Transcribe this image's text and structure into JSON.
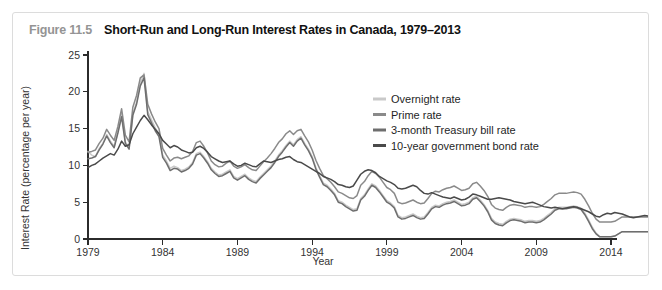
{
  "figure": {
    "number": "Figure 11.5",
    "title": "Short-Run and Long-Run Interest Rates in Canada, 1979–2013"
  },
  "chart_data": {
    "type": "line",
    "title": "Short-Run and Long-Run Interest Rates in Canada, 1979–2013",
    "xlabel": "Year",
    "ylabel": "Interest Rate (percentage per year)",
    "xlim": [
      1979,
      2014
    ],
    "ylim": [
      0,
      25
    ],
    "xticks": [
      1979,
      1984,
      1989,
      1994,
      1999,
      2004,
      2009,
      2014
    ],
    "yticks": [
      0,
      5,
      10,
      15,
      20,
      25
    ],
    "grid": false,
    "legend_position": "inside-top-right",
    "x_step": 0.25,
    "series": [
      {
        "name": "Overnight rate",
        "color": "#c9c9c9",
        "values": [
          11.9,
          11.4,
          11.2,
          12.3,
          13.0,
          14.2,
          13.3,
          12.6,
          14.6,
          16.9,
          13.2,
          12.4,
          17.0,
          18.6,
          21.2,
          22.5,
          17.3,
          16.2,
          15.1,
          14.2,
          11.4,
          10.6,
          9.6,
          9.9,
          9.7,
          9.3,
          9.5,
          9.8,
          10.4,
          11.6,
          11.8,
          11.2,
          10.5,
          9.6,
          9.1,
          8.7,
          8.8,
          9.1,
          9.4,
          8.5,
          8.2,
          8.5,
          8.8,
          8.3,
          8.0,
          7.8,
          8.4,
          8.9,
          9.4,
          9.9,
          10.6,
          11.4,
          12.0,
          12.7,
          13.3,
          12.8,
          13.5,
          13.9,
          13.0,
          12.2,
          11.2,
          9.7,
          8.6,
          7.6,
          7.3,
          6.8,
          6.2,
          5.2,
          5.0,
          4.6,
          4.3,
          4.0,
          4.1,
          5.5,
          6.0,
          6.8,
          7.5,
          7.2,
          6.6,
          5.9,
          5.2,
          4.9,
          4.4,
          3.2,
          2.9,
          3.0,
          3.2,
          3.4,
          3.1,
          2.9,
          3.0,
          3.6,
          4.3,
          4.6,
          4.5,
          4.8,
          5.0,
          5.1,
          5.3,
          5.0,
          4.7,
          4.8,
          5.0,
          5.6,
          5.8,
          5.3,
          4.7,
          3.9,
          2.8,
          2.3,
          2.1,
          2.0,
          2.4,
          2.7,
          2.8,
          2.7,
          2.6,
          2.4,
          2.5,
          2.5,
          2.4,
          2.5,
          2.8,
          3.2,
          3.6,
          4.1,
          4.3,
          4.3,
          4.3,
          4.4,
          4.5,
          4.4,
          4.2,
          3.5,
          2.6,
          1.6,
          0.8,
          0.3,
          0.3,
          0.3,
          0.3,
          0.4,
          0.7,
          1.0,
          1.0,
          1.0,
          1.0,
          1.0,
          1.0,
          1.0,
          1.0,
          1.0,
          1.0,
          1.0,
          1.0,
          1.0,
          1.0,
          1.0,
          1.0,
          1.0
        ]
      },
      {
        "name": "Prime rate",
        "color": "#8a8a8a",
        "values": [
          11.8,
          11.9,
          12.1,
          13.0,
          13.7,
          14.9,
          14.1,
          13.4,
          15.3,
          17.7,
          14.1,
          13.2,
          17.9,
          19.5,
          21.9,
          22.3,
          18.3,
          17.0,
          15.9,
          15.0,
          12.3,
          11.4,
          10.6,
          11.0,
          11.1,
          10.9,
          11.1,
          11.3,
          11.9,
          13.1,
          13.3,
          12.6,
          11.7,
          10.6,
          10.1,
          9.8,
          9.9,
          10.3,
          10.6,
          9.9,
          9.6,
          9.8,
          10.1,
          9.7,
          9.4,
          9.3,
          9.9,
          10.5,
          11.0,
          11.6,
          12.3,
          13.1,
          13.6,
          14.3,
          14.7,
          14.2,
          14.7,
          14.9,
          14.0,
          13.2,
          12.1,
          10.7,
          9.6,
          8.6,
          8.2,
          7.7,
          7.1,
          6.4,
          6.2,
          5.9,
          5.6,
          5.5,
          5.9,
          7.3,
          7.8,
          8.6,
          9.2,
          8.9,
          8.4,
          7.7,
          7.0,
          6.7,
          6.2,
          5.0,
          4.8,
          4.9,
          5.1,
          5.3,
          5.0,
          4.8,
          4.9,
          5.5,
          6.2,
          6.5,
          6.4,
          6.7,
          6.9,
          7.0,
          7.2,
          6.9,
          6.6,
          6.7,
          6.9,
          7.5,
          7.7,
          7.2,
          6.6,
          5.8,
          4.7,
          4.2,
          4.0,
          3.9,
          4.3,
          4.6,
          4.7,
          4.6,
          4.5,
          4.3,
          4.4,
          4.4,
          4.3,
          4.4,
          4.7,
          5.1,
          5.5,
          6.0,
          6.2,
          6.2,
          6.2,
          6.3,
          6.4,
          6.3,
          6.1,
          5.4,
          4.5,
          3.5,
          2.7,
          2.3,
          2.3,
          2.3,
          2.3,
          2.4,
          2.7,
          3.0,
          3.0,
          3.0,
          3.0,
          3.0,
          3.0,
          3.0,
          3.0,
          3.0,
          3.0,
          3.0,
          3.0,
          3.0,
          3.0,
          3.0,
          3.0,
          3.0
        ]
      },
      {
        "name": "3-month Treasury bill rate",
        "color": "#6e6e6e",
        "values": [
          10.9,
          11.0,
          11.2,
          12.1,
          12.9,
          14.0,
          13.1,
          12.4,
          14.4,
          16.6,
          13.0,
          12.2,
          16.8,
          18.3,
          20.8,
          21.9,
          16.9,
          15.8,
          14.7,
          13.9,
          11.1,
          10.3,
          9.3,
          9.6,
          9.5,
          9.1,
          9.3,
          9.6,
          10.2,
          11.4,
          11.6,
          11.0,
          10.3,
          9.4,
          8.9,
          8.5,
          8.6,
          8.9,
          9.2,
          8.3,
          8.0,
          8.3,
          8.6,
          8.1,
          7.8,
          7.6,
          8.2,
          8.7,
          9.2,
          9.7,
          10.4,
          11.2,
          11.8,
          12.5,
          13.1,
          12.6,
          13.3,
          13.7,
          12.8,
          12.0,
          11.0,
          9.5,
          8.4,
          7.4,
          7.1,
          6.6,
          6.0,
          5.0,
          4.8,
          4.4,
          4.1,
          3.8,
          3.9,
          5.3,
          5.8,
          6.6,
          7.3,
          7.0,
          6.4,
          5.7,
          5.0,
          4.7,
          4.2,
          3.0,
          2.7,
          2.8,
          3.0,
          3.2,
          2.9,
          2.7,
          2.8,
          3.4,
          4.1,
          4.4,
          4.3,
          4.6,
          4.8,
          4.9,
          5.1,
          4.8,
          4.5,
          4.6,
          4.8,
          5.4,
          5.6,
          5.1,
          4.5,
          3.7,
          2.6,
          2.1,
          1.9,
          1.8,
          2.2,
          2.5,
          2.6,
          2.5,
          2.4,
          2.2,
          2.3,
          2.3,
          2.2,
          2.3,
          2.6,
          3.0,
          3.4,
          3.9,
          4.1,
          4.1,
          4.1,
          4.2,
          4.3,
          4.2,
          4.0,
          3.3,
          2.4,
          1.4,
          0.7,
          0.3,
          0.3,
          0.3,
          0.3,
          0.4,
          0.7,
          1.0,
          1.0,
          1.0,
          1.0,
          1.0,
          1.0,
          1.0,
          1.0,
          1.0,
          1.0,
          1.0,
          1.0,
          1.0,
          1.0,
          1.0,
          1.0,
          1.0
        ]
      },
      {
        "name": "10-year government bond rate",
        "color": "#4a4a4a",
        "values": [
          9.7,
          10.0,
          10.2,
          10.6,
          11.0,
          11.3,
          11.6,
          11.4,
          12.2,
          13.3,
          12.6,
          12.8,
          14.3,
          15.2,
          16.1,
          16.8,
          16.2,
          15.5,
          14.9,
          14.3,
          13.4,
          12.9,
          12.4,
          12.7,
          12.5,
          12.1,
          11.9,
          11.7,
          11.8,
          12.4,
          12.6,
          12.3,
          11.8,
          11.2,
          10.9,
          10.6,
          10.4,
          10.5,
          10.6,
          10.2,
          9.9,
          10.0,
          10.3,
          10.1,
          9.9,
          9.8,
          10.2,
          10.6,
          10.5,
          10.4,
          10.6,
          10.8,
          10.9,
          11.1,
          11.2,
          10.8,
          10.5,
          10.4,
          10.1,
          9.8,
          9.5,
          9.2,
          8.9,
          8.5,
          8.3,
          8.1,
          7.8,
          7.4,
          7.3,
          7.1,
          7.0,
          7.2,
          8.0,
          8.8,
          9.2,
          9.4,
          9.3,
          9.0,
          8.5,
          8.2,
          7.9,
          7.7,
          7.4,
          6.9,
          6.8,
          6.9,
          7.1,
          7.3,
          7.1,
          6.6,
          6.2,
          6.1,
          6.3,
          6.1,
          5.9,
          5.7,
          5.6,
          5.5,
          5.7,
          5.5,
          5.3,
          5.4,
          5.7,
          6.1,
          6.0,
          5.8,
          5.6,
          5.4,
          5.4,
          5.5,
          5.6,
          5.5,
          5.4,
          5.3,
          5.1,
          5.0,
          4.9,
          4.8,
          4.9,
          5.0,
          4.8,
          4.6,
          4.4,
          4.3,
          4.2,
          4.3,
          4.2,
          4.1,
          4.2,
          4.3,
          4.4,
          4.3,
          4.1,
          3.9,
          3.7,
          3.4,
          3.1,
          3.0,
          3.3,
          3.5,
          3.4,
          3.6,
          3.5,
          3.4,
          3.2,
          3.0,
          2.9,
          3.0,
          3.1,
          3.2,
          3.1,
          3.0,
          2.9,
          3.0,
          3.1,
          3.2,
          3.2,
          3.1,
          3.1,
          3.1
        ]
      }
    ]
  }
}
